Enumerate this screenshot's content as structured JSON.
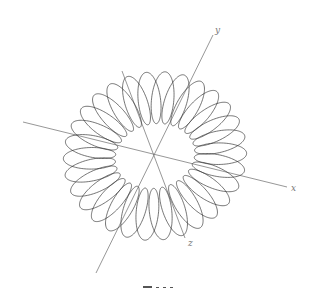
{
  "figure": {
    "type": "3d-parametric-curve",
    "canvas": {
      "width": 312,
      "height": 289
    },
    "colors": {
      "curve": "#3a3a3a",
      "axes": "#6a6a6a",
      "labels": "#777777",
      "background": "#ffffff"
    },
    "origin": [
      155,
      156
    ],
    "axes": [
      {
        "name": "x",
        "label": "x",
        "from": [
          23,
          122
        ],
        "to": [
          287,
          187
        ],
        "label_pos": [
          291,
          191
        ]
      },
      {
        "name": "y",
        "label": "y",
        "from": [
          96,
          273
        ],
        "to": [
          213,
          35
        ],
        "label_pos": [
          215,
          33
        ]
      },
      {
        "name": "z",
        "label": "z",
        "from": [
          122,
          71
        ],
        "to": [
          185,
          238
        ],
        "label_pos": [
          188,
          246
        ]
      }
    ],
    "curve": {
      "turns": 30,
      "major_radius": 1.0,
      "minor_radius": 0.42,
      "samples": 3000,
      "projection": {
        "ex": [
          0.468,
          0.115
        ],
        "ey": [
          0.0,
          0.0
        ],
        "ez": [
          0.13,
          -0.395
        ],
        "tube_x": [
          0.468,
          0.115
        ],
        "tube_y": [
          0.205,
          -0.42
        ],
        "scale": 1.0,
        "ring_rx": 66,
        "ring_ry": 58,
        "tube_r": 26
      }
    },
    "caption": {
      "text": ""
    }
  }
}
